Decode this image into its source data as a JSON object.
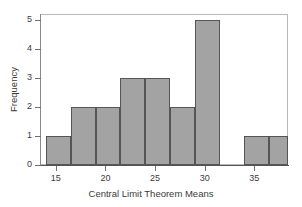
{
  "chart_data": {
    "type": "bar",
    "title": "",
    "xlabel": "Central Limit Theorem Means",
    "ylabel": "Frequency",
    "xlim": [
      13.4,
      38.4
    ],
    "ylim": [
      0,
      5.2
    ],
    "grid": false,
    "legend": null,
    "bin_width": 2.5,
    "bar_color": "#a3a3a3",
    "bar_edge_color": "#555555",
    "x_ticks": [
      15,
      20,
      25,
      30,
      35
    ],
    "x_tick_labels": [
      "15",
      "20",
      "25",
      "30",
      "35"
    ],
    "y_ticks": [
      0,
      1,
      2,
      3,
      4,
      5
    ],
    "y_tick_labels": [
      "0",
      "1",
      "2",
      "3",
      "4",
      "5"
    ],
    "bins": [
      {
        "left": 14.0,
        "right": 16.5,
        "value": 1
      },
      {
        "left": 16.5,
        "right": 19.0,
        "value": 2
      },
      {
        "left": 19.0,
        "right": 21.5,
        "value": 2
      },
      {
        "left": 21.5,
        "right": 24.0,
        "value": 3
      },
      {
        "left": 24.0,
        "right": 26.5,
        "value": 3
      },
      {
        "left": 26.5,
        "right": 29.0,
        "value": 2
      },
      {
        "left": 29.0,
        "right": 31.5,
        "value": 5
      },
      {
        "left": 31.5,
        "right": 34.0,
        "value": 0
      },
      {
        "left": 34.0,
        "right": 36.5,
        "value": 1
      },
      {
        "left": 36.5,
        "right": 38.4,
        "value": 1
      }
    ],
    "categories": [
      "14.0-16.5",
      "16.5-19.0",
      "19.0-21.5",
      "21.5-24.0",
      "24.0-26.5",
      "26.5-29.0",
      "29.0-31.5",
      "31.5-34.0",
      "34.0-36.5",
      "36.5-38.4"
    ],
    "values": [
      1,
      2,
      2,
      3,
      3,
      2,
      5,
      0,
      1,
      1
    ]
  }
}
